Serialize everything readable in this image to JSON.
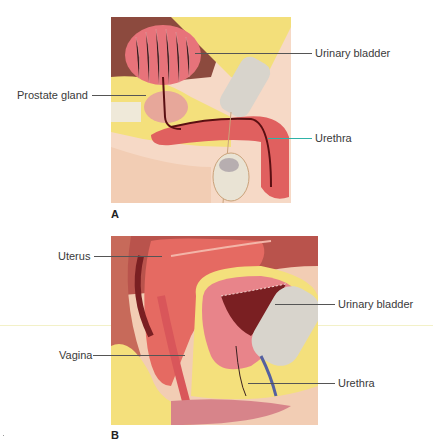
{
  "figure": {
    "panels": [
      {
        "letter": "A",
        "subject": "male pelvis sagittal section",
        "labels": {
          "urinary_bladder": "Urinary bladder",
          "prostate_gland": "Prostate gland",
          "urethra": "Urethra"
        }
      },
      {
        "letter": "B",
        "subject": "female pelvis sagittal section",
        "labels": {
          "uterus": "Uterus",
          "urinary_bladder": "Urinary bladder",
          "vagina": "Vagina",
          "urethra": "Urethra"
        }
      }
    ],
    "colors": {
      "muscle_red": "#e0605f",
      "bladder_pink": "#e8848a",
      "fat_yellow": "#f5e27a",
      "bone_gray": "#d8d4cc",
      "skin": "#f2cdb4",
      "dark_cavity": "#7a1f22",
      "leader_line": "#555555",
      "urethra_leader_teal": "#2fb3a8"
    }
  }
}
